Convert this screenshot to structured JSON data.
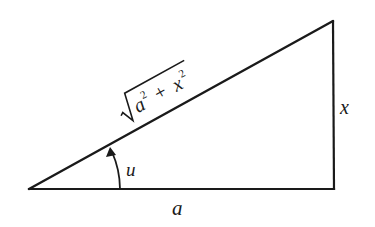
{
  "diagram": {
    "type": "right-triangle",
    "stroke_color": "#1a1a1a",
    "background": "#ffffff",
    "vertices": {
      "bottom_left": [
        29,
        189
      ],
      "bottom_right": [
        334,
        189
      ],
      "top_right": [
        332,
        22
      ]
    },
    "labels": {
      "base": "a",
      "height": "x",
      "angle": "u",
      "hypotenuse": {
        "radical_symbol": "√",
        "term1_base": "a",
        "term1_exp": "2",
        "operator": "+",
        "term2_base": "x",
        "term2_exp": "2"
      }
    },
    "angle_marker": {
      "arrow": true,
      "from_side": "base",
      "to_side": "hypotenuse"
    }
  }
}
